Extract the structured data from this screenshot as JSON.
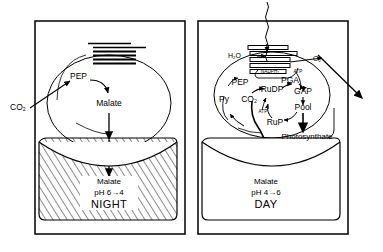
{
  "figure": {
    "type": "biological-pathway-diagram",
    "stroke_color": "#000000",
    "background_color": "#ffffff"
  },
  "panels": [
    {
      "id": "night",
      "phase_label": "NIGHT",
      "cell_border": "rounded-rectangle",
      "chloroplast": {
        "shape": "ellipse",
        "grana_label": "grana-stack",
        "grana_lines": 6
      },
      "external_inputs": [
        {
          "name": "co2-input",
          "label": "CO",
          "sub": "2"
        }
      ],
      "metabolites": [
        {
          "name": "pep",
          "label": "PEP"
        },
        {
          "name": "malate-cytosol",
          "label": "Malate"
        }
      ],
      "vacuole": {
        "name": "vacuole-night",
        "hatched": true,
        "lines": [
          {
            "name": "vacuole-malate",
            "label": "Malate"
          },
          {
            "name": "vacuole-ph",
            "label": "pH 6→4"
          },
          {
            "name": "vacuole-phase",
            "label": "NIGHT"
          }
        ]
      }
    },
    {
      "id": "day",
      "phase_label": "DAY",
      "cell_border": "rounded-rectangle",
      "light_ray": {
        "name": "light-ray-icon",
        "label": ""
      },
      "chloroplast": {
        "shape": "ellipse",
        "grana_label": "grana-stack",
        "grana_lines": 5
      },
      "external_inputs": [
        {
          "name": "water-input",
          "label": "H",
          "sub": "2",
          "tail": "O"
        }
      ],
      "external_outputs": [
        {
          "name": "oxygen-output",
          "label": "O",
          "sub": "2"
        }
      ],
      "cofactors": [
        {
          "name": "nadph2",
          "label": "NADPH",
          "sub": "2"
        },
        {
          "name": "atp-light",
          "label": "ATP"
        },
        {
          "name": "atp-calvin",
          "label": "ATP"
        }
      ],
      "metabolites": [
        {
          "name": "pep",
          "label": "PEP"
        },
        {
          "name": "pyruvate",
          "label": "Py"
        },
        {
          "name": "co2-internal",
          "label": "CO",
          "sub": "2"
        },
        {
          "name": "rudp",
          "label": "RuDP"
        },
        {
          "name": "pga",
          "label": "PGA"
        },
        {
          "name": "gap",
          "label": "GAP"
        },
        {
          "name": "pool",
          "label": "Pool"
        },
        {
          "name": "rup",
          "label": "RuP"
        },
        {
          "name": "photosynthate",
          "label": "Photosynthate"
        }
      ],
      "vacuole": {
        "name": "vacuole-day",
        "hatched": false,
        "lines": [
          {
            "name": "vacuole-malate",
            "label": "Malate"
          },
          {
            "name": "vacuole-ph",
            "label": "pH 4→6"
          },
          {
            "name": "vacuole-phase",
            "label": "DAY"
          }
        ]
      }
    }
  ]
}
